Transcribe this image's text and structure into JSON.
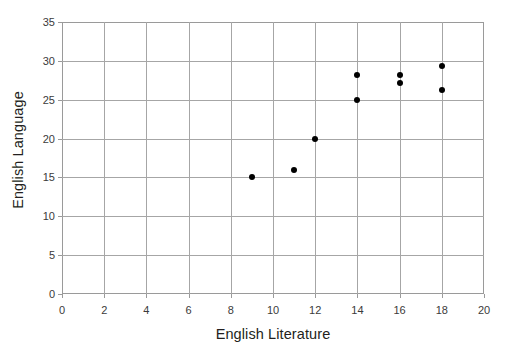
{
  "chart_data": {
    "type": "scatter",
    "title": "",
    "xlabel": "English Literature",
    "ylabel": "English Language",
    "xlim": [
      0,
      20
    ],
    "ylim": [
      0,
      35
    ],
    "xticks": [
      "0",
      "2",
      "4",
      "6",
      "8",
      "10",
      "12",
      "14",
      "16",
      "18",
      "20"
    ],
    "yticks": [
      "0",
      "5",
      "10",
      "15",
      "20",
      "25",
      "30",
      "35"
    ],
    "xtick_step": 2,
    "ytick_step": 5,
    "grid": true,
    "grid_color": "#a6a6a6",
    "legend": null,
    "marker_color": "#000000",
    "points": [
      {
        "x": 9,
        "y": 15
      },
      {
        "x": 11,
        "y": 16
      },
      {
        "x": 12,
        "y": 20
      },
      {
        "x": 14,
        "y": 25
      },
      {
        "x": 14,
        "y": 28.2
      },
      {
        "x": 16,
        "y": 27.2
      },
      {
        "x": 16,
        "y": 28.2
      },
      {
        "x": 18,
        "y": 26.3
      },
      {
        "x": 18,
        "y": 29.3
      }
    ]
  }
}
